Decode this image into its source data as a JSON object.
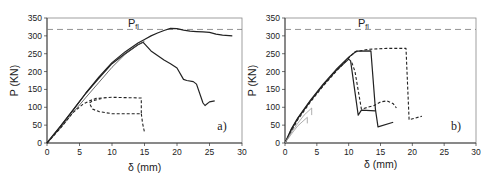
{
  "chart_data": [
    {
      "type": "line",
      "panel_label": "a)",
      "xlabel": "δ (mm)",
      "ylabel": "P (KN)",
      "xlim": [
        0,
        30
      ],
      "ylim": [
        0,
        350
      ],
      "xticks": [
        0,
        5,
        10,
        15,
        20,
        25,
        30
      ],
      "yticks": [
        0,
        50,
        100,
        150,
        200,
        250,
        300,
        350
      ],
      "grid": false,
      "legend": null,
      "reference_line": {
        "label": "Pfl",
        "label_main": "P",
        "label_sub": "fl",
        "y": 318,
        "style": "dashed"
      },
      "series": [
        {
          "name": "curve-1-solid-upper",
          "style": "solid",
          "x": [
            0,
            2,
            4,
            6,
            8,
            10,
            12,
            14,
            15,
            16,
            17,
            18,
            19,
            20,
            21,
            22,
            23,
            24,
            25,
            26,
            27,
            28.5
          ],
          "y": [
            0,
            45,
            92,
            140,
            185,
            225,
            255,
            280,
            290,
            300,
            308,
            315,
            321,
            320,
            316,
            313,
            312,
            311,
            310,
            305,
            302,
            300
          ]
        },
        {
          "name": "curve-2-solid-lower",
          "style": "solid",
          "x": [
            0,
            2,
            4,
            6,
            8,
            10,
            12,
            14,
            14.8,
            16,
            17,
            18,
            19,
            20,
            21,
            21.5,
            22.5,
            23,
            24,
            24.3,
            25,
            25.8
          ],
          "y": [
            0,
            45,
            92,
            140,
            182,
            222,
            250,
            275,
            282,
            258,
            245,
            232,
            222,
            210,
            178,
            175,
            172,
            165,
            112,
            105,
            115,
            118
          ]
        },
        {
          "name": "curve-3-thin-double",
          "style": "solid-thin",
          "x": [
            0,
            2,
            4,
            6,
            8,
            10,
            12,
            14,
            15
          ],
          "y": [
            0,
            40,
            85,
            128,
            170,
            212,
            248,
            275,
            285
          ]
        },
        {
          "name": "curve-4-dashed",
          "style": "dashed",
          "x": [
            0,
            2,
            4,
            5.5,
            6.5,
            7.5,
            10,
            14.5,
            14.5,
            10,
            8,
            7,
            6.5,
            7,
            8.5
          ],
          "y": [
            0,
            40,
            85,
            108,
            118,
            125,
            128,
            126,
            82,
            82,
            88,
            95,
            112,
            118,
            125
          ]
        },
        {
          "name": "curve-4-dashed-tail",
          "style": "dashed",
          "x": [
            14.5,
            14.7,
            15
          ],
          "y": [
            82,
            55,
            30
          ]
        }
      ]
    },
    {
      "type": "line",
      "panel_label": "b)",
      "xlabel": "δ (mm)",
      "ylabel": "P (KN)",
      "xlim": [
        0,
        30
      ],
      "ylim": [
        0,
        350
      ],
      "xticks": [
        0,
        5,
        10,
        15,
        20,
        25,
        30
      ],
      "yticks": [
        0,
        50,
        100,
        150,
        200,
        250,
        300,
        350
      ],
      "grid": false,
      "legend": null,
      "reference_line": {
        "label": "Pfl",
        "label_main": "P",
        "label_sub": "fl",
        "y": 318,
        "style": "dashed"
      },
      "series": [
        {
          "name": "curve-1-solid",
          "style": "solid",
          "x": [
            0,
            1,
            2,
            4,
            6,
            8,
            10,
            11.2,
            13.5,
            14.2,
            14.6,
            17
          ],
          "y": [
            0,
            40,
            70,
            120,
            165,
            205,
            240,
            257,
            258,
            95,
            45,
            58
          ]
        },
        {
          "name": "curve-2-solid",
          "style": "solid",
          "x": [
            0,
            1,
            2,
            4,
            6,
            8,
            10,
            10.3,
            11.5,
            12,
            14.2
          ],
          "y": [
            0,
            38,
            68,
            118,
            162,
            202,
            235,
            230,
            78,
            92,
            90
          ]
        },
        {
          "name": "curve-3-dashed-long",
          "style": "dashed",
          "x": [
            0,
            2,
            4,
            6,
            8,
            10,
            11,
            13,
            16,
            19,
            19.5,
            21.5
          ],
          "y": [
            0,
            65,
            115,
            160,
            200,
            238,
            255,
            262,
            265,
            265,
            65,
            75
          ]
        },
        {
          "name": "curve-4-dashed-short",
          "style": "dashed",
          "x": [
            10.5,
            11,
            12,
            13,
            14,
            15,
            16,
            17,
            17.5
          ],
          "y": [
            225,
            200,
            95,
            100,
            105,
            115,
            118,
            110,
            98
          ]
        },
        {
          "name": "curve-5-thin-initial",
          "style": "solid-thin-gray",
          "x": [
            0,
            1,
            2,
            3,
            4.2,
            4.2
          ],
          "y": [
            0,
            30,
            55,
            78,
            98,
            78
          ]
        },
        {
          "name": "curve-6-thin-initial",
          "style": "solid-thin-gray",
          "x": [
            0,
            1,
            2,
            3.5,
            3.5
          ],
          "y": [
            0,
            25,
            48,
            72,
            55
          ]
        }
      ]
    }
  ]
}
